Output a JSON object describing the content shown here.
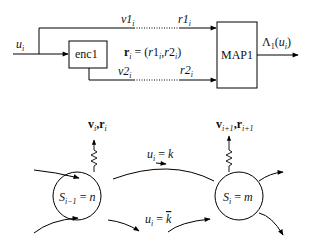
{
  "figure": {
    "top_block_diagram": {
      "input_label": "u_i",
      "encoder": {
        "label": "enc1"
      },
      "decoder": {
        "label": "MAP1"
      },
      "output_label": "Λ1(ui)",
      "upper_path": {
        "tx_label": "v1i",
        "rx_label": "r1i"
      },
      "lower_path": {
        "tx_label": "v2i",
        "rx_label": "r2i"
      },
      "received_vector": "ri = (r1i, r2i)"
    },
    "trellis": {
      "left_state": {
        "label": "Si−1 = n",
        "output_label": "vi, ri"
      },
      "right_state": {
        "label": "Si = m",
        "output_label": "vi+1, ri+1"
      },
      "transitions": [
        {
          "label": "ui = k"
        },
        {
          "label": "ui = k̄"
        }
      ]
    }
  }
}
